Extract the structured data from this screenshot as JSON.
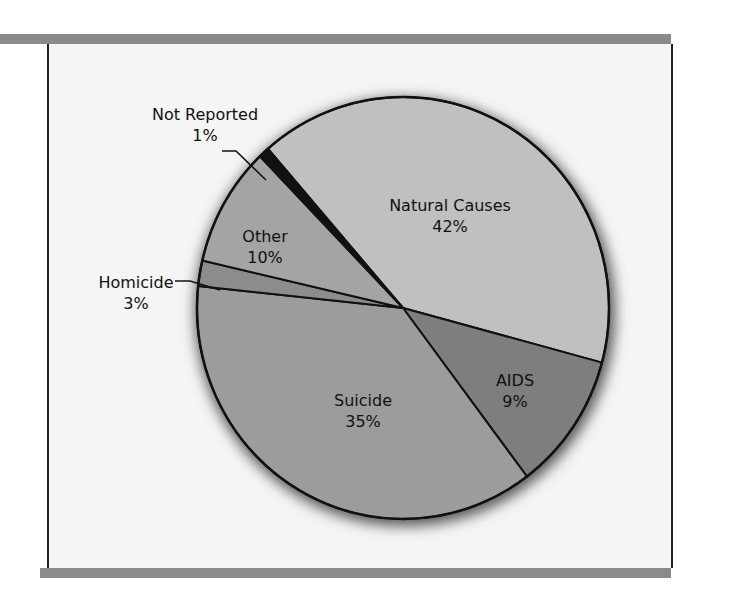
{
  "chart_data": {
    "type": "pie",
    "title": "",
    "note": "Wedge geometry is drawn from edges measured in the screenshot. Each wedge's visible span differs slightly from its printed label (Homicide in particular measures nearer 2% than 3%); the printed label values are recorded here as the chart's data.",
    "slices": [
      {
        "label": "Natural Causes",
        "percent": 42,
        "percent_label": "42%",
        "color": "#c0c0c0",
        "drawn_start_deg": 229,
        "drawn_end_deg": 375
      },
      {
        "label": "AIDS",
        "percent": 9,
        "percent_label": "9%",
        "color": "#7e7e7e",
        "drawn_start_deg": 15,
        "drawn_end_deg": 53
      },
      {
        "label": "Suicide",
        "percent": 35,
        "percent_label": "35%",
        "color": "#9c9c9c",
        "drawn_start_deg": 53,
        "drawn_end_deg": 186
      },
      {
        "label": "Homicide",
        "percent": 3,
        "percent_label": "3%",
        "color": "#8c8c8c",
        "drawn_start_deg": 186,
        "drawn_end_deg": 193
      },
      {
        "label": "Other",
        "percent": 10,
        "percent_label": "10%",
        "color": "#a4a4a4",
        "drawn_start_deg": 193,
        "drawn_end_deg": 226
      },
      {
        "label": "Not Reported",
        "percent": 1,
        "percent_label": "1%",
        "color": "#111111",
        "drawn_start_deg": 226,
        "drawn_end_deg": 229
      }
    ]
  }
}
